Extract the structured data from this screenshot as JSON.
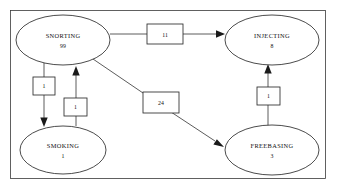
{
  "diagram": {
    "frame": {
      "present": true,
      "color": "#3a3a3a"
    },
    "background": "#ffffff",
    "nodes": [
      {
        "id": "snorting",
        "label": "SNORTING",
        "value": "99",
        "shape": "ellipse",
        "cx": 63,
        "cy": 40,
        "rx": 47,
        "ry": 25
      },
      {
        "id": "injecting",
        "label": "INJECTING",
        "value": "8",
        "shape": "ellipse",
        "cx": 272,
        "cy": 40,
        "rx": 47,
        "ry": 25
      },
      {
        "id": "smoking",
        "label": "SMOKING",
        "value": "1",
        "shape": "ellipse",
        "cx": 63,
        "cy": 150,
        "rx": 43,
        "ry": 24
      },
      {
        "id": "freebasing",
        "label": "FREEBASING",
        "value": "3",
        "shape": "ellipse",
        "cx": 272,
        "cy": 150,
        "rx": 47,
        "ry": 25
      }
    ],
    "edges": [
      {
        "id": "snorting-to-injecting",
        "from": "SNORTING",
        "to": "INJECTING",
        "label": "11"
      },
      {
        "id": "snorting-to-freebasing",
        "from": "SNORTING",
        "to": "FREEBASING",
        "label": "24"
      },
      {
        "id": "snorting-to-smoking",
        "from": "SNORTING",
        "to": "SMOKING",
        "label": "1"
      },
      {
        "id": "smoking-to-snorting",
        "from": "SMOKING",
        "to": "SNORTING",
        "label": "1"
      },
      {
        "id": "freebasing-to-injecting",
        "from": "FREEBASING",
        "to": "INJECTING",
        "label": "1"
      }
    ]
  }
}
